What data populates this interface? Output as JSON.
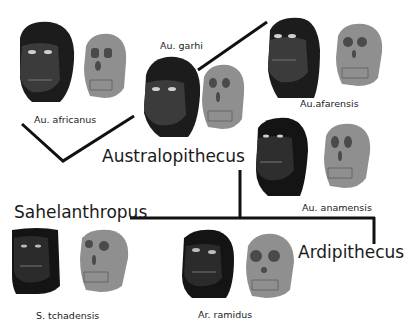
{
  "diagram": {
    "title": "",
    "colors": {
      "line": "#111111",
      "head": "#1c1c1c",
      "face": "#3a3a3a",
      "skull": "#8f8f8f",
      "skull_shadow": "#555555",
      "background": "#ffffff"
    },
    "genera": {
      "australopithecus": "Australopithecus",
      "sahelanthropus": "Sahelanthropus",
      "ardipithecus": "Ardipithecus"
    },
    "species": [
      {
        "id": "au-africanus",
        "label": "Au. africanus"
      },
      {
        "id": "au-garhi",
        "label": "Au. garhi"
      },
      {
        "id": "au-afarensis",
        "label": "Au.afarensis"
      },
      {
        "id": "au-anamensis",
        "label": "Au. anamensis"
      },
      {
        "id": "s-tchadensis",
        "label": "S. tchadensis"
      },
      {
        "id": "ar-ramidus",
        "label": "Ar. ramidus"
      }
    ]
  }
}
